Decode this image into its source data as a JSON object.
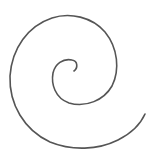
{
  "image": {
    "subject": "spiral",
    "background_color": "#ffffff",
    "stroke_color": "#555555",
    "turns": 2.5,
    "direction": "outward-clockwise-from-center"
  },
  "spiral": {
    "inner_end": [
      74,
      70
    ],
    "outer_end": [
      145,
      114
    ],
    "path": "M 74 71 C 78 68, 78 61, 72 60 C 63 58, 55 64, 53 73 C 51 84, 55 98, 69 103 C 86 108, 104 100, 112 86 C 120 70, 118 48, 105 32 C 92 17, 70 12, 52 18 C 28 26, 12 48, 10 76 C 9 104, 24 130, 50 142 C 72 151, 98 150, 118 140 C 132 133, 141 123, 145 114"
  }
}
